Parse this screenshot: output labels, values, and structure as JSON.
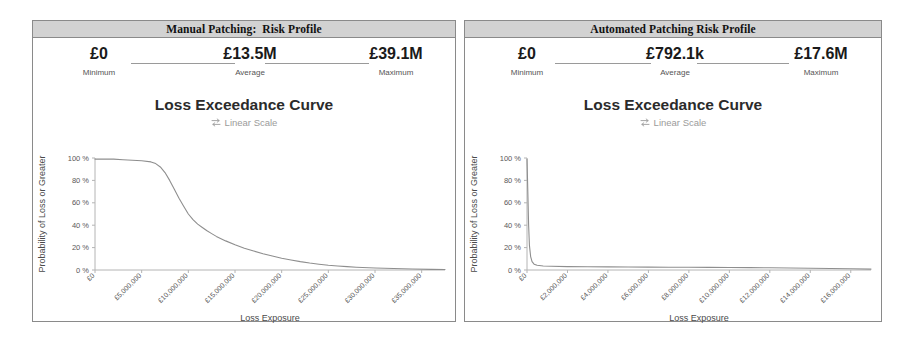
{
  "panels": [
    {
      "header": "Manual Patching:  Risk Profile",
      "stats": [
        {
          "value": "£0",
          "label": "Minimum"
        },
        {
          "value": "£13.5M",
          "label": "Average"
        },
        {
          "value": "£39.1M",
          "label": "Maximum"
        }
      ],
      "chart_title": "Loss Exceedance Curve",
      "scale_toggle": "Linear Scale",
      "scale_icon": "swap-horizontal-icon"
    },
    {
      "header": "Automated Patching Risk Profile",
      "stats": [
        {
          "value": "£0",
          "label": "Minimum"
        },
        {
          "value": "£792.1k",
          "label": "Average"
        },
        {
          "value": "£17.6M",
          "label": "Maximum"
        }
      ],
      "chart_title": "Loss Exceedance Curve",
      "scale_toggle": "Linear Scale",
      "scale_icon": "swap-horizontal-icon"
    }
  ],
  "chart_data": [
    {
      "type": "line",
      "title": "Loss Exceedance Curve",
      "subtitle": "Linear Scale",
      "xlabel": "Loss Exposure",
      "ylabel": "Probability of Loss or Greater",
      "xlim": [
        0,
        37500000
      ],
      "ylim": [
        0,
        100
      ],
      "grid": false,
      "legend": "none",
      "xticks": [
        0,
        5000000,
        10000000,
        15000000,
        20000000,
        25000000,
        30000000,
        35000000
      ],
      "xticklabels": [
        "£0",
        "£5,000,000",
        "£10,000,000",
        "£15,000,000",
        "£20,000,000",
        "£25,000,000",
        "£30,000,000",
        "£35,000,000"
      ],
      "yticks": [
        0,
        20,
        40,
        60,
        80,
        100
      ],
      "yticklabels": [
        "0 %",
        "20 %",
        "40 %",
        "60 %",
        "80 %",
        "100 %"
      ],
      "series": [
        {
          "name": "Manual Patching Loss Exceedance",
          "x": [
            0,
            1000000,
            2000000,
            3000000,
            4000000,
            5000000,
            6000000,
            6500000,
            7000000,
            7500000,
            8000000,
            8500000,
            9000000,
            9500000,
            10000000,
            10500000,
            11000000,
            11500000,
            12000000,
            12500000,
            13000000,
            14000000,
            15000000,
            16000000,
            17000000,
            18000000,
            19000000,
            20000000,
            21000000,
            22000000,
            23000000,
            24000000,
            25000000,
            26000000,
            27000000,
            28000000,
            30000000,
            32000000,
            34000000,
            36000000,
            37500000
          ],
          "y": [
            99,
            99,
            99,
            98.5,
            98,
            97.5,
            96.5,
            95,
            92,
            87,
            80,
            72,
            64,
            57,
            50,
            45,
            41,
            38,
            35,
            32.5,
            30,
            26,
            22.5,
            19.5,
            17,
            14.5,
            12.5,
            10.5,
            9,
            7.5,
            6.2,
            5.2,
            4.3,
            3.6,
            3,
            2.5,
            1.8,
            1.3,
            0.9,
            0.6,
            0.4
          ]
        }
      ]
    },
    {
      "type": "line",
      "title": "Loss Exceedance Curve",
      "subtitle": "Linear Scale",
      "xlabel": "Loss Exposure",
      "ylabel": "Probability of Loss or Greater",
      "xlim": [
        0,
        17000000
      ],
      "ylim": [
        0,
        100
      ],
      "grid": false,
      "legend": "none",
      "xticks": [
        0,
        2000000,
        4000000,
        6000000,
        8000000,
        10000000,
        12000000,
        14000000,
        16000000
      ],
      "xticklabels": [
        "£0",
        "£2,000,000",
        "£4,000,000",
        "£6,000,000",
        "£8,000,000",
        "£10,000,000",
        "£12,000,000",
        "£14,000,000",
        "£16,000,000"
      ],
      "yticks": [
        0,
        20,
        40,
        60,
        80,
        100
      ],
      "yticklabels": [
        "0 %",
        "20 %",
        "40 %",
        "60 %",
        "80 %",
        "100 %"
      ],
      "series": [
        {
          "name": "Automated Patching Loss Exceedance",
          "x": [
            0,
            40000,
            80000,
            120000,
            180000,
            250000,
            350000,
            500000,
            800000,
            1200000,
            2000000,
            3000000,
            4000000,
            5000000,
            6000000,
            7000000,
            8000000,
            9000000,
            10000000,
            11000000,
            12000000,
            13000000,
            14000000,
            15000000,
            16000000,
            17000000
          ],
          "y": [
            99,
            70,
            40,
            22,
            12,
            7.5,
            5.2,
            4.2,
            3.6,
            3.3,
            3.0,
            2.9,
            2.8,
            2.7,
            2.6,
            2.5,
            2.4,
            2.3,
            2.2,
            2.1,
            2.0,
            1.8,
            1.6,
            1.4,
            1.1,
            0.8
          ]
        }
      ]
    }
  ]
}
